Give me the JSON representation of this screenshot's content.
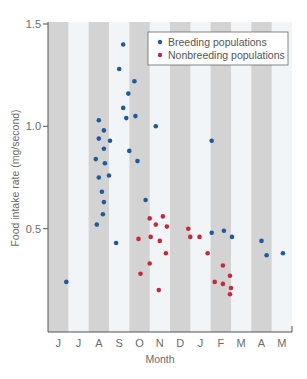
{
  "chart_data": {
    "type": "scatter",
    "title": "",
    "xlabel": "Month",
    "ylabel": "Food intake rate (mg/second)",
    "ylim": [
      0,
      1.5
    ],
    "yticks": [
      0.5,
      1.0,
      1.5
    ],
    "ytick_labels": [
      "0.5",
      "1.0",
      "1.5"
    ],
    "categories": [
      "J",
      "J",
      "A",
      "S",
      "O",
      "N",
      "D",
      "J",
      "F",
      "M",
      "A",
      "M"
    ],
    "grid": false,
    "background": "alternating gray/white month stripes",
    "legend_position": "upper right",
    "series": [
      {
        "name": "Breeding populations",
        "color": "#1f5a9e",
        "points": [
          {
            "x": 0.9,
            "y": 0.24
          },
          {
            "x": 2.5,
            "y": 1.03
          },
          {
            "x": 2.75,
            "y": 0.98
          },
          {
            "x": 2.5,
            "y": 0.94
          },
          {
            "x": 3.05,
            "y": 0.93
          },
          {
            "x": 2.75,
            "y": 0.89
          },
          {
            "x": 2.35,
            "y": 0.84
          },
          {
            "x": 2.8,
            "y": 0.82
          },
          {
            "x": 3.0,
            "y": 0.76
          },
          {
            "x": 2.5,
            "y": 0.75
          },
          {
            "x": 2.65,
            "y": 0.68
          },
          {
            "x": 2.75,
            "y": 0.63
          },
          {
            "x": 2.7,
            "y": 0.57
          },
          {
            "x": 2.4,
            "y": 0.52
          },
          {
            "x": 3.35,
            "y": 0.43
          },
          {
            "x": 3.7,
            "y": 1.4
          },
          {
            "x": 3.5,
            "y": 1.28
          },
          {
            "x": 4.25,
            "y": 1.22
          },
          {
            "x": 3.95,
            "y": 1.16
          },
          {
            "x": 3.7,
            "y": 1.09
          },
          {
            "x": 3.85,
            "y": 1.04
          },
          {
            "x": 4.3,
            "y": 1.05
          },
          {
            "x": 5.3,
            "y": 1.0
          },
          {
            "x": 4.0,
            "y": 0.88
          },
          {
            "x": 4.4,
            "y": 0.83
          },
          {
            "x": 4.8,
            "y": 0.64
          },
          {
            "x": 8.05,
            "y": 0.93
          },
          {
            "x": 8.05,
            "y": 0.48
          },
          {
            "x": 8.65,
            "y": 0.49
          },
          {
            "x": 9.05,
            "y": 0.46
          },
          {
            "x": 10.5,
            "y": 0.44
          },
          {
            "x": 10.75,
            "y": 0.37
          },
          {
            "x": 11.55,
            "y": 0.38
          }
        ]
      },
      {
        "name": "Nonbreeding populations",
        "color": "#c8283a",
        "points": [
          {
            "x": 4.45,
            "y": 0.45
          },
          {
            "x": 4.55,
            "y": 0.28
          },
          {
            "x": 5.0,
            "y": 0.55
          },
          {
            "x": 5.3,
            "y": 0.52
          },
          {
            "x": 5.65,
            "y": 0.56
          },
          {
            "x": 5.85,
            "y": 0.51
          },
          {
            "x": 5.05,
            "y": 0.46
          },
          {
            "x": 5.5,
            "y": 0.44
          },
          {
            "x": 5.8,
            "y": 0.38
          },
          {
            "x": 5.0,
            "y": 0.33
          },
          {
            "x": 5.45,
            "y": 0.2
          },
          {
            "x": 6.9,
            "y": 0.5
          },
          {
            "x": 7.0,
            "y": 0.46
          },
          {
            "x": 7.45,
            "y": 0.46
          },
          {
            "x": 7.85,
            "y": 0.38
          },
          {
            "x": 8.6,
            "y": 0.32
          },
          {
            "x": 8.2,
            "y": 0.24
          },
          {
            "x": 8.6,
            "y": 0.23
          },
          {
            "x": 8.95,
            "y": 0.27
          },
          {
            "x": 9.0,
            "y": 0.21
          },
          {
            "x": 8.95,
            "y": 0.18
          }
        ]
      }
    ]
  },
  "legend": {
    "items": [
      {
        "label": "Breeding populations",
        "color": "#1f5a9e"
      },
      {
        "label": "Nonbreeding populations",
        "color": "#c8283a"
      }
    ]
  },
  "axes": {
    "x_title": "Month",
    "y_title": "Food intake rate (mg/second)",
    "x_labels": [
      "J",
      "J",
      "A",
      "S",
      "O",
      "N",
      "D",
      "J",
      "F",
      "M",
      "A",
      "M"
    ],
    "y_labels": [
      "0.5",
      "1.0",
      "1.5"
    ]
  },
  "colors": {
    "stripe_gray": "#d3d3d3",
    "stripe_light": "#f2f5f7",
    "axis": "#555555"
  }
}
